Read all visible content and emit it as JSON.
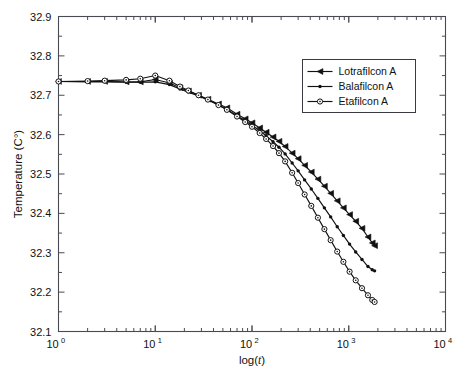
{
  "chart_data": {
    "type": "line",
    "title": "",
    "xlabel": "log(t)",
    "ylabel": "Temperature (C°)",
    "xscale": "log",
    "yscale": "linear",
    "xlim": [
      1,
      10000
    ],
    "ylim": [
      32.1,
      32.9
    ],
    "grid": false,
    "legend_position": "upper right",
    "xtick_labels": [
      "10",
      "10",
      "10",
      "10",
      "10"
    ],
    "xtick_exponents": [
      "0",
      "1",
      "2",
      "3",
      "4"
    ],
    "xtick_values": [
      1,
      10,
      100,
      1000,
      10000
    ],
    "ytick_labels": [
      "32.1",
      "32.2",
      "32.3",
      "32.4",
      "32.5",
      "32.6",
      "32.7",
      "32.8",
      "32.9"
    ],
    "ytick_values": [
      32.1,
      32.2,
      32.3,
      32.4,
      32.5,
      32.6,
      32.7,
      32.8,
      32.9
    ],
    "series": [
      {
        "name": "Lotrafilcon A",
        "marker": "triangle-left",
        "color": "#111111",
        "x": [
          1,
          2,
          3,
          5,
          7,
          10,
          14,
          18,
          22,
          28,
          35,
          45,
          55,
          70,
          85,
          100,
          120,
          140,
          165,
          190,
          220,
          260,
          300,
          350,
          410,
          480,
          560,
          650,
          760,
          880,
          1020,
          1180,
          1370,
          1580,
          1750,
          1850
        ],
        "y": [
          32.735,
          32.735,
          32.735,
          32.734,
          32.734,
          32.74,
          32.731,
          32.719,
          32.711,
          32.7,
          32.69,
          32.678,
          32.668,
          32.652,
          32.64,
          32.63,
          32.617,
          32.606,
          32.594,
          32.583,
          32.57,
          32.553,
          32.539,
          32.522,
          32.505,
          32.487,
          32.469,
          32.451,
          32.432,
          32.414,
          32.397,
          32.38,
          32.362,
          32.34,
          32.325,
          32.318
        ]
      },
      {
        "name": "Balafilcon A",
        "marker": "star",
        "color": "#111111",
        "x": [
          1,
          2,
          3,
          5,
          7,
          10,
          14,
          18,
          22,
          28,
          35,
          45,
          55,
          70,
          85,
          100,
          120,
          140,
          165,
          190,
          220,
          260,
          300,
          350,
          410,
          480,
          560,
          650,
          760,
          880,
          1020,
          1180,
          1370,
          1580,
          1750,
          1850
        ],
        "y": [
          32.735,
          32.734,
          32.734,
          32.733,
          32.733,
          32.734,
          32.727,
          32.716,
          32.708,
          32.698,
          32.688,
          32.675,
          32.664,
          32.648,
          32.635,
          32.624,
          32.61,
          32.597,
          32.582,
          32.568,
          32.551,
          32.528,
          32.508,
          32.485,
          32.462,
          32.438,
          32.414,
          32.391,
          32.366,
          32.344,
          32.322,
          32.302,
          32.283,
          32.265,
          32.257,
          32.254
        ]
      },
      {
        "name": "Etafilcon A",
        "marker": "circle",
        "color": "#111111",
        "x": [
          1,
          2,
          3,
          5,
          7,
          10,
          14,
          18,
          22,
          28,
          35,
          45,
          55,
          70,
          85,
          100,
          120,
          140,
          165,
          190,
          220,
          260,
          300,
          350,
          410,
          480,
          560,
          650,
          760,
          880,
          1020,
          1180,
          1370,
          1580,
          1750,
          1850
        ],
        "y": [
          32.735,
          32.736,
          32.737,
          32.739,
          32.742,
          32.75,
          32.737,
          32.722,
          32.712,
          32.7,
          32.689,
          32.675,
          32.663,
          32.646,
          32.632,
          32.62,
          32.604,
          32.589,
          32.571,
          32.553,
          32.532,
          32.503,
          32.477,
          32.448,
          32.419,
          32.389,
          32.36,
          32.332,
          32.303,
          32.277,
          32.252,
          32.23,
          32.21,
          32.192,
          32.18,
          32.175
        ]
      }
    ]
  },
  "legend": {
    "entries": [
      {
        "label": "Lotrafilcon A"
      },
      {
        "label": "Balafilcon A"
      },
      {
        "label": "Etafilcon A"
      }
    ]
  }
}
